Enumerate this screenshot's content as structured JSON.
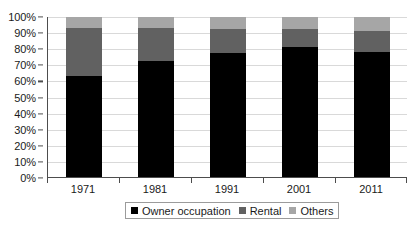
{
  "chart_data": {
    "type": "bar",
    "stacked": true,
    "stack_total": 100,
    "title": "",
    "subtitle": "",
    "xlabel": "",
    "ylabel": "",
    "categories": [
      "1971",
      "1981",
      "1991",
      "2001",
      "2011"
    ],
    "series": [
      {
        "name": "Owner occupation",
        "color": "#000000",
        "values": [
          63,
          72.5,
          77.5,
          81,
          78
        ]
      },
      {
        "name": "Rental",
        "color": "#616161",
        "values": [
          30,
          20.5,
          15,
          11.5,
          13
        ]
      },
      {
        "name": "Others",
        "color": "#a6a6a6",
        "values": [
          7,
          7,
          7.5,
          7.5,
          9
        ]
      }
    ],
    "ylim": [
      0,
      100
    ],
    "ytick_values": [
      0,
      10,
      20,
      30,
      40,
      50,
      60,
      70,
      80,
      90,
      100
    ],
    "ytick_labels": [
      "0%",
      "10%",
      "20%",
      "30%",
      "40%",
      "50%",
      "60%",
      "70%",
      "80%",
      "90%",
      "100%"
    ],
    "grid": true,
    "grid_axis": "y",
    "legend_position": "bottom",
    "legend_entries": [
      "Owner occupation",
      "Rental",
      "Others"
    ],
    "annotations": []
  },
  "colors": {
    "axis": "#4d4d4d",
    "gridline": "#d9d9d9",
    "text": "#1a1a1a",
    "legend_border": "#9b9b9b",
    "background": "#ffffff"
  }
}
